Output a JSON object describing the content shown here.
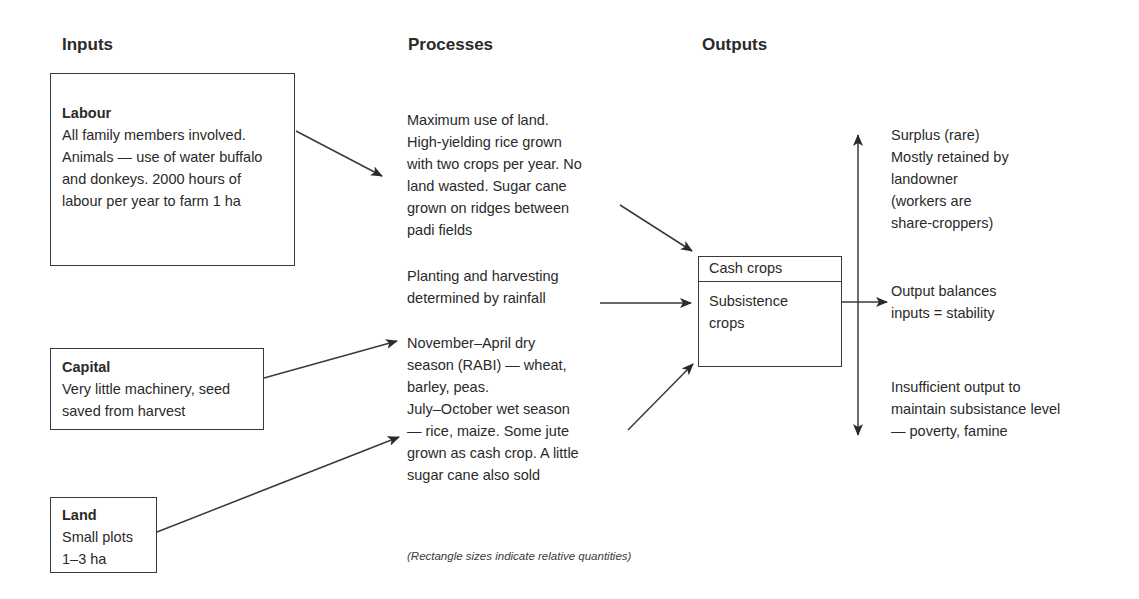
{
  "headers": {
    "inputs": "Inputs",
    "processes": "Processes",
    "outputs": "Outputs"
  },
  "inputs": [
    {
      "title": "Labour",
      "text": "All family members involved. Animals — use of water buffalo and donkeys. 2000 hours of labour per year to farm 1 ha"
    },
    {
      "title": "Capital",
      "text": "Very little machinery, seed saved from harvest"
    },
    {
      "title": "Land",
      "text": "Small plots 1–3 ha"
    }
  ],
  "processes": [
    {
      "text": "Maximum use of land.\nHigh-yielding rice grown\nwith two crops per year. No\nland wasted. Sugar cane\ngrown on ridges between\npadi fields"
    },
    {
      "text": "Planting and harvesting\ndetermined by rainfall"
    },
    {
      "text": "November–April dry\nseason (RABI) — wheat,\nbarley, peas.\nJuly–October wet season\n— rice, maize. Some jute\ngrown as cash crop. A little\nsugar cane also sold"
    }
  ],
  "crops_box": {
    "top_label": "Cash crops",
    "bottom_label": "Subsistence\ncrops"
  },
  "outputs": [
    {
      "text": "Surplus (rare)\nMostly retained by\nlandowner\n(workers are\nshare-croppers)"
    },
    {
      "text": "Output balances\ninputs = stability"
    },
    {
      "text": "Insufficient output to\nmaintain subsistance level\n— poverty, famine"
    }
  ],
  "caption": "(Rectangle sizes indicate relative quantities)",
  "colors": {
    "stroke": "#3a3a3a",
    "text": "#2a2a2a",
    "background": "#ffffff"
  }
}
